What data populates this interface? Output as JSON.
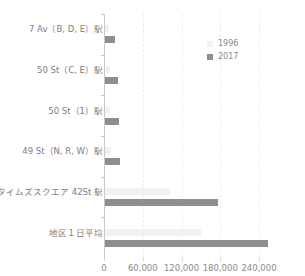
{
  "chart_data": {
    "type": "bar",
    "orientation": "horizontal",
    "title": "",
    "xlabel": "",
    "ylabel": "",
    "categories": [
      "7 Av（B, D, E）駅",
      "50 St（C, E）駅",
      "50 St（1）駅",
      "49 St（N, R, W）駅",
      "タイムズスクエア 42St 駅",
      "地区１日平均"
    ],
    "series": [
      {
        "name": "1996",
        "color": "#f1f1f1",
        "values": [
          6000,
          7000,
          8000,
          9000,
          100000,
          149000
        ]
      },
      {
        "name": "2017",
        "color": "#8e8e8e",
        "values": [
          15000,
          20000,
          21000,
          23000,
          175000,
          252000
        ]
      }
    ],
    "xticks": [
      "0",
      "60,000",
      "120,000",
      "180,000",
      "240,000"
    ],
    "xtick_values": [
      0,
      60000,
      120000,
      180000,
      240000
    ],
    "xlim": [
      0,
      265000
    ],
    "grid": "vertical dashed",
    "legend_position": "top-right"
  },
  "legend": [
    {
      "label": "1996",
      "color": "#f1f1f1"
    },
    {
      "label": "2017",
      "color": "#8e8e8e"
    }
  ]
}
